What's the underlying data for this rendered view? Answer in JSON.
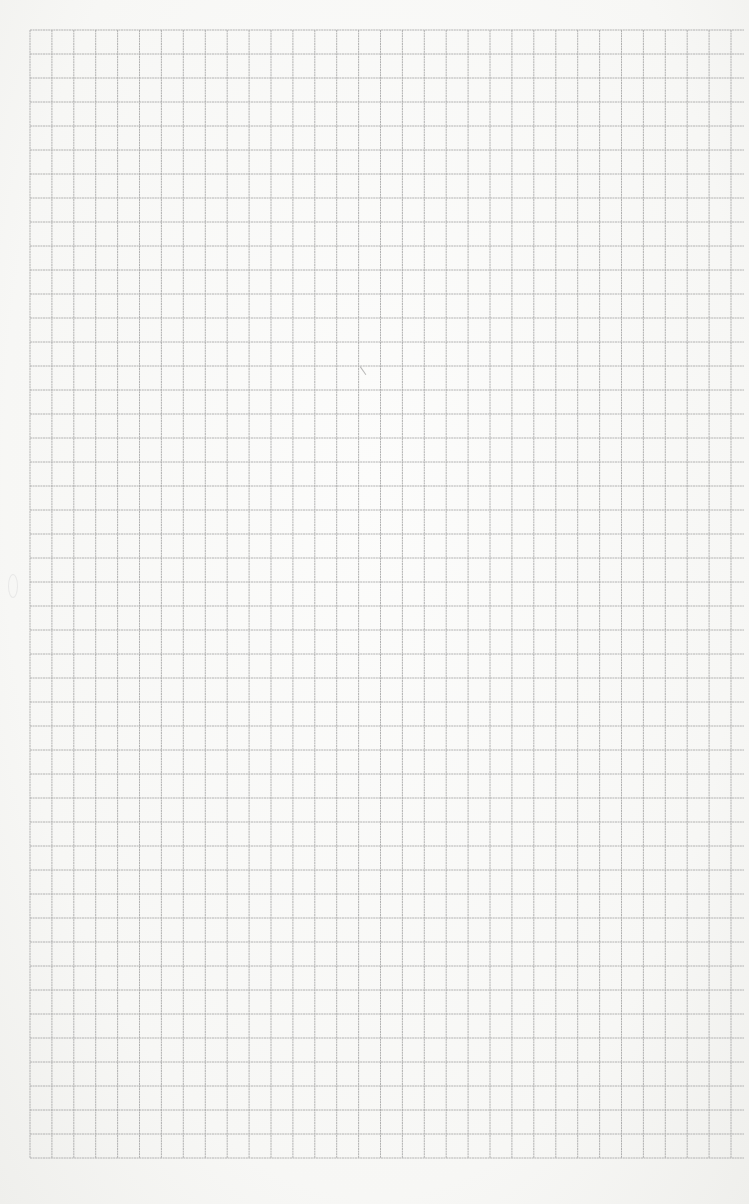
{
  "scene": {
    "description": "Scanned sheet of blank graph paper",
    "background_color": "#f6f6f4",
    "grid": {
      "left": 30,
      "top": 30,
      "right": 731,
      "bottom": 1158,
      "columns": 32,
      "rows": 47,
      "cell_width": 21.9,
      "cell_height": 24,
      "line_color": "#a9a9a9",
      "horizontal_overhang_right": 744
    },
    "marks": [
      {
        "name": "pencil-mark",
        "x": 362,
        "y": 364
      },
      {
        "name": "edge-smudge",
        "x": 8,
        "y": 574
      }
    ]
  }
}
